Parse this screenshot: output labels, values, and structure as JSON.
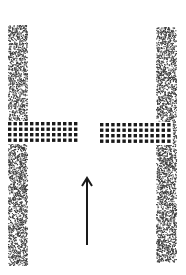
{
  "diagram": {
    "colors": {
      "background": "#ffffff",
      "ink": "#1a1a1a",
      "stipple": "#3a3a3a"
    },
    "walls": [
      {
        "name": "left-wall",
        "x": 8,
        "y": 25,
        "w": 19,
        "h": 240
      },
      {
        "name": "right-wall",
        "x": 156,
        "y": 27,
        "w": 20,
        "h": 235
      }
    ],
    "barriers": [
      {
        "name": "left-barrier",
        "x": 8,
        "y": 122,
        "cols": 13,
        "rows": 4,
        "pitch_x": 5.5,
        "pitch_y": 5.5,
        "dot": 3.4
      },
      {
        "name": "right-barrier",
        "x": 100,
        "y": 123,
        "cols": 13,
        "rows": 4,
        "pitch_x": 5.6,
        "pitch_y": 5.5,
        "dot": 3.4
      }
    ],
    "arrow": {
      "direction": "up",
      "x": 87,
      "y_tail": 245,
      "y_head": 178
    }
  }
}
